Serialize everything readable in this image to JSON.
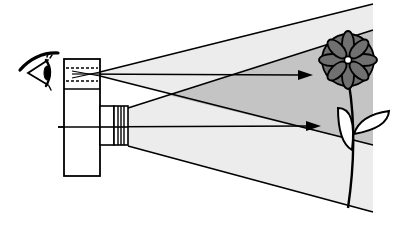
{
  "diagram": {
    "elements": [
      {
        "id": "eye",
        "label": "eye"
      },
      {
        "id": "viewfinder",
        "label": "viewfinder window"
      },
      {
        "id": "camera-body",
        "label": "camera body"
      },
      {
        "id": "lens",
        "label": "lens"
      },
      {
        "id": "viewfinder-field",
        "label": "viewfinder field of view"
      },
      {
        "id": "lens-field",
        "label": "lens field of view"
      },
      {
        "id": "flower",
        "label": "flower subject"
      }
    ],
    "colors": {
      "line": "#000000",
      "light_field": "#ececec",
      "overlap_field": "#c4c4c4",
      "flower_petal": "#707070",
      "background": "#ffffff"
    }
  }
}
